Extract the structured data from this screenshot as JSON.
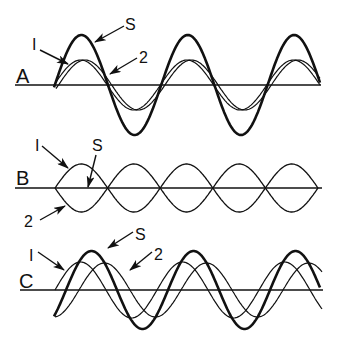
{
  "figure": {
    "ink_color": "#111111",
    "background": "#ffffff"
  },
  "panels": [
    {
      "id": "A",
      "label": "A",
      "label_pos": [
        16,
        83
      ],
      "axis": {
        "y": 85,
        "x1": 15,
        "x2": 321
      },
      "waves": [
        {
          "name": "1",
          "x0": 54,
          "x1": 320,
          "halfPeriod": 53.2,
          "amp": 25,
          "phase": 0,
          "width": 1.2
        },
        {
          "name": "2",
          "x0": 56,
          "x1": 320,
          "halfPeriod": 53.2,
          "amp": 25,
          "phase": 2.5,
          "width": 1.2
        },
        {
          "name": "S",
          "x0": 54,
          "x1": 320,
          "halfPeriod": 53.2,
          "amp": 50,
          "phase": 0.8,
          "width": 2.6
        }
      ],
      "callouts": [
        {
          "text": "I",
          "text_pos": [
            32,
            50
          ],
          "from": [
            40,
            50
          ],
          "to": [
            68,
            64
          ]
        },
        {
          "text": "S",
          "text_pos": [
            125,
            30
          ],
          "from": [
            124,
            26
          ],
          "to": [
            95,
            42
          ]
        },
        {
          "text": "2",
          "text_pos": [
            139,
            63
          ],
          "from": [
            137,
            58
          ],
          "to": [
            110,
            74
          ]
        }
      ]
    },
    {
      "id": "B",
      "label": "B",
      "label_pos": [
        16,
        185
      ],
      "axis": {
        "y": 188,
        "x1": 15,
        "x2": 322
      },
      "waves": [
        {
          "name": "1",
          "x0": 55,
          "x1": 318,
          "halfPeriod": 52.6,
          "amp": 24,
          "phase": 0,
          "width": 1.3
        },
        {
          "name": "2",
          "x0": 55,
          "x1": 318,
          "halfPeriod": 52.6,
          "amp": -24,
          "phase": 0,
          "width": 1.3
        }
      ],
      "s_line": {
        "x1": 88,
        "y1": 188,
        "x2": 88,
        "y2": 188
      },
      "callouts": [
        {
          "text": "I",
          "text_pos": [
            35,
            151
          ],
          "from": [
            42,
            146
          ],
          "to": [
            68,
            168
          ]
        },
        {
          "text": "S",
          "text_pos": [
            92,
            151
          ],
          "from": [
            96,
            155
          ],
          "to": [
            88,
            187
          ]
        },
        {
          "text": "2",
          "text_pos": [
            24,
            227
          ],
          "from": [
            40,
            220
          ],
          "to": [
            65,
            206
          ]
        }
      ]
    },
    {
      "id": "C",
      "label": "C",
      "label_pos": [
        19,
        288
      ],
      "axis": {
        "y": 290,
        "x1": 20,
        "x2": 323
      },
      "waves": [
        {
          "name": "1",
          "x0": 55,
          "x1": 322,
          "halfPeriod": 51,
          "amp": 28,
          "phase": 0,
          "width": 1.2
        },
        {
          "name": "2",
          "x0": 55,
          "x1": 322,
          "halfPeriod": 51,
          "amp": 27,
          "phase": 24,
          "width": 1.2
        },
        {
          "name": "S",
          "x0": 54,
          "x1": 320,
          "halfPeriod": 51,
          "amp": 39,
          "phase": 12,
          "width": 2.6
        }
      ],
      "callouts": [
        {
          "text": "I",
          "text_pos": [
            29,
            261
          ],
          "from": [
            38,
            252
          ],
          "to": [
            64,
            270
          ]
        },
        {
          "text": "S",
          "text_pos": [
            135,
            240
          ],
          "from": [
            133,
            232
          ],
          "to": [
            108,
            248
          ]
        },
        {
          "text": "2",
          "text_pos": [
            154,
            260
          ],
          "from": [
            152,
            252
          ],
          "to": [
            130,
            270
          ]
        }
      ]
    }
  ]
}
